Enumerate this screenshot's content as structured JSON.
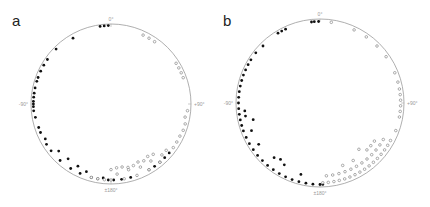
{
  "chart_data": [
    {
      "type": "scatter",
      "subtype": "polar-circular",
      "panel": "a",
      "title": "",
      "axis_labels": {
        "top": "0°",
        "left": "-90°",
        "right": "+90°",
        "bottom": "±180°"
      },
      "circle": {
        "cx": 111,
        "cy": 104,
        "r": 80
      },
      "series": [
        {
          "name": "filled",
          "marker": "filled-circle",
          "color": "#111111",
          "angles_deg": [
            -2,
            -5,
            -8,
            -30,
            -45,
            -55,
            -60,
            -65,
            -70,
            -73,
            -78,
            -82,
            -85,
            -88,
            -90,
            -92,
            -95,
            -100,
            -108,
            -112,
            -118,
            -122,
            -128,
            -132,
            -138,
            -142,
            -148,
            -152,
            -156,
            -160,
            -165,
            -170,
            -174,
            -178,
            178,
            172,
            165,
            150,
            145,
            140,
            135,
            130
          ],
          "radii": [
            0.98,
            0.98,
            0.98,
            0.95,
            0.97,
            0.97,
            0.97,
            0.97,
            0.97,
            0.97,
            0.97,
            0.97,
            0.97,
            0.97,
            0.97,
            0.97,
            0.97,
            0.96,
            0.95,
            0.95,
            0.93,
            0.95,
            0.95,
            0.88,
            0.95,
            0.87,
            0.95,
            0.88,
            0.95,
            0.9,
            0.95,
            0.95,
            0.93,
            0.95,
            0.95,
            0.95,
            0.95,
            0.95,
            0.95,
            0.95,
            0.95,
            0.95
          ]
        },
        {
          "name": "open",
          "marker": "open-circle",
          "color": "#777777",
          "angles_deg": [
            25,
            30,
            35,
            58,
            62,
            66,
            70,
            95,
            100,
            105,
            110,
            115,
            120,
            125,
            130,
            135,
            140,
            145,
            150,
            155,
            160,
            165,
            170,
            175,
            180,
            -175,
            -170,
            -165,
            140,
            145,
            150,
            155,
            160,
            165,
            170,
            175,
            180
          ],
          "radii": [
            0.95,
            0.95,
            0.95,
            0.96,
            0.96,
            0.96,
            0.96,
            0.96,
            0.94,
            0.96,
            0.96,
            0.95,
            0.95,
            0.95,
            0.9,
            0.9,
            0.95,
            0.87,
            0.95,
            0.87,
            0.95,
            0.85,
            0.95,
            0.88,
            0.95,
            0.95,
            0.95,
            0.95,
            0.82,
            0.8,
            0.82,
            0.8,
            0.82,
            0.82,
            0.8,
            0.8,
            0.82
          ]
        }
      ]
    },
    {
      "type": "scatter",
      "subtype": "polar-circular",
      "panel": "b",
      "title": "",
      "axis_labels": {
        "top": "0°",
        "left": "-90°",
        "right": "+90°",
        "bottom": "±180°"
      },
      "circle": {
        "cx": 320,
        "cy": 103,
        "r": 84
      },
      "series": [
        {
          "name": "filled",
          "marker": "filled-circle",
          "color": "#111111",
          "angles_deg": [
            -1,
            -4,
            -6,
            -25,
            -28,
            -31,
            -45,
            -52,
            -58,
            -62,
            -66,
            -70,
            -74,
            -78,
            -82,
            -86,
            -90,
            -94,
            -98,
            -102,
            -106,
            -110,
            -115,
            -120,
            -125,
            -130,
            -135,
            -140,
            -145,
            -150,
            -155,
            -160,
            -165,
            -170,
            -175,
            -180,
            178,
            -96,
            -100,
            -104,
            -112,
            -124,
            -140,
            -145,
            -150,
            -165
          ],
          "radii": [
            0.97,
            0.97,
            0.97,
            0.97,
            0.97,
            0.97,
            0.96,
            0.97,
            0.97,
            0.97,
            0.97,
            0.97,
            0.97,
            0.97,
            0.97,
            0.97,
            0.97,
            0.97,
            0.97,
            0.97,
            0.97,
            0.97,
            0.97,
            0.97,
            0.97,
            0.97,
            0.97,
            0.97,
            0.97,
            0.97,
            0.97,
            0.97,
            0.97,
            0.97,
            0.97,
            0.97,
            0.97,
            0.9,
            0.9,
            0.82,
            0.88,
            0.88,
            0.85,
            0.82,
            0.85,
            0.88
          ]
        },
        {
          "name": "open",
          "marker": "open-circle",
          "color": "#777777",
          "angles_deg": [
            8,
            25,
            35,
            45,
            55,
            68,
            75,
            80,
            84,
            88,
            92,
            96,
            100,
            110,
            118,
            122,
            126,
            130,
            134,
            138,
            142,
            146,
            150,
            154,
            158,
            162,
            166,
            170,
            174,
            178,
            120,
            125,
            130,
            135,
            140,
            145,
            150,
            155,
            160,
            165,
            170,
            175,
            125,
            130,
            135,
            140,
            150,
            160
          ],
          "radii": [
            0.97,
            0.96,
            0.96,
            0.96,
            0.96,
            0.96,
            0.96,
            0.96,
            0.96,
            0.96,
            0.96,
            0.96,
            0.96,
            0.96,
            0.95,
            0.95,
            0.95,
            0.95,
            0.95,
            0.95,
            0.95,
            0.95,
            0.95,
            0.95,
            0.95,
            0.95,
            0.95,
            0.95,
            0.95,
            0.95,
            0.87,
            0.87,
            0.87,
            0.87,
            0.87,
            0.87,
            0.87,
            0.87,
            0.87,
            0.87,
            0.87,
            0.87,
            0.79,
            0.79,
            0.79,
            0.72,
            0.79,
            0.79
          ]
        }
      ]
    }
  ],
  "panels": {
    "a": {
      "label": "a"
    },
    "b": {
      "label": "b"
    }
  }
}
